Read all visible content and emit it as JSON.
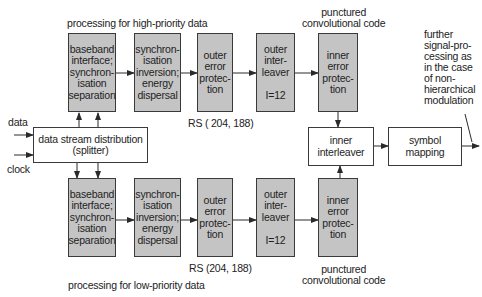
{
  "diagram": {
    "high_priority_title": "processing for high-priority data",
    "low_priority_title": "processing for low-priority data",
    "inputs": {
      "data": "data",
      "clock": "clock"
    },
    "splitter": "data stream distribution\n(splitter)",
    "top": {
      "baseband": "baseband\ninterface;\nsynchron-\nisation\nseparation",
      "sync_inversion": "synchron-\nisation\ninversion;\nenergy\ndispersal",
      "outer_error": "outer\nerror\nprotec-\ntion",
      "outer_interleaver": "outer\ninter-\nleaver\n\nI=12",
      "inner_error": "inner\nerror\nprotec-\ntion",
      "rs_label": "RS ( 204, 188)",
      "punctured_label": "punctured\nconvolutional code"
    },
    "bottom": {
      "baseband": "baseband\ninterface;\nsynchron-\nisation\nseparation",
      "sync_inversion": "synchron-\nisation\ninversion;\nenergy\ndispersal",
      "outer_error": "outer\nerror\nprotec-\ntion",
      "outer_interleaver": "outer\ninter-\nleaver\n\nI=12",
      "inner_error": "inner\nerror\nprotec-\ntion",
      "rs_label": "RS (204, 188)",
      "punctured_label": "punctured\nconvolutional code"
    },
    "inner_interleaver": "inner\ninterleaver",
    "symbol_mapping": "symbol\nmapping",
    "note": "further\nsignal-pro-\ncessing as\nin the case\nof non-\nhierarchical\nmodulation",
    "colors": {
      "block_fill": "#c4c4c4",
      "line": "#2a2a2a"
    }
  }
}
